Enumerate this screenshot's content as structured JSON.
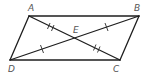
{
  "diagram": {
    "type": "parallelogram-with-diagonals",
    "points": {
      "A": {
        "x": 29,
        "y": 16,
        "label": "A",
        "lx": 28,
        "ly": 11
      },
      "B": {
        "x": 139,
        "y": 16,
        "label": "B",
        "lx": 134,
        "ly": 11
      },
      "C": {
        "x": 120,
        "y": 60,
        "label": "C",
        "lx": 113,
        "ly": 72
      },
      "D": {
        "x": 10,
        "y": 60,
        "label": "D",
        "lx": 8,
        "ly": 72
      },
      "E": {
        "x": 74,
        "y": 38,
        "label": "E",
        "lx": 73,
        "ly": 33
      }
    },
    "labels": [
      "A",
      "B",
      "C",
      "D",
      "E"
    ],
    "segments": [
      "AB",
      "BC",
      "CD",
      "DA",
      "AC",
      "BD"
    ],
    "congruence_marks": {
      "AE_EC": "double tick",
      "DE_EB": "single tick"
    },
    "colors": {
      "line": "#1e1e1e",
      "label": "#555555"
    }
  }
}
